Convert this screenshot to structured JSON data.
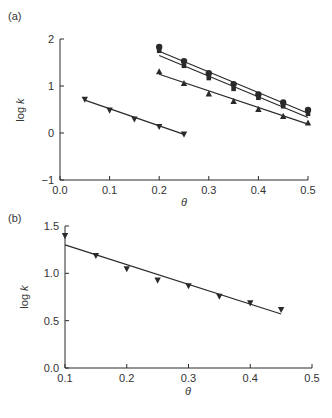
{
  "chart_data": [
    {
      "panel_label": "(a)",
      "type": "scatter",
      "xlabel": "θ",
      "ylabel": "log k",
      "xlim": [
        0.0,
        0.5
      ],
      "ylim": [
        -1,
        2
      ],
      "xticks": [
        "0.0",
        "0.1",
        "0.2",
        "0.3",
        "0.4",
        "0.5"
      ],
      "yticks": [
        "-1",
        "0",
        "1",
        "2"
      ],
      "grid": false,
      "legend": null,
      "series": [
        {
          "name": "circles",
          "marker": "circle",
          "x": [
            0.2,
            0.25,
            0.3,
            0.35,
            0.4,
            0.45,
            0.5
          ],
          "values": [
            1.83,
            1.53,
            1.27,
            1.04,
            0.82,
            0.65,
            0.49
          ],
          "fit": [
            [
              0.2,
              1.74
            ],
            [
              0.5,
              0.42
            ]
          ]
        },
        {
          "name": "squares",
          "marker": "square",
          "x": [
            0.2,
            0.25,
            0.3,
            0.35,
            0.4,
            0.45,
            0.5
          ],
          "values": [
            1.75,
            1.43,
            1.17,
            0.94,
            0.75,
            0.57,
            0.41
          ],
          "fit": [
            [
              0.2,
              1.65
            ],
            [
              0.5,
              0.33
            ]
          ]
        },
        {
          "name": "triangles-up",
          "marker": "triangle-up",
          "x": [
            0.2,
            0.25,
            0.3,
            0.35,
            0.4,
            0.45,
            0.5
          ],
          "values": [
            1.3,
            1.05,
            0.83,
            0.67,
            0.5,
            0.35,
            0.21
          ],
          "fit": [
            [
              0.2,
              1.25
            ],
            [
              0.5,
              0.19
            ]
          ]
        },
        {
          "name": "triangles-down",
          "marker": "triangle-down",
          "x": [
            0.05,
            0.1,
            0.15,
            0.2,
            0.25
          ],
          "values": [
            0.72,
            0.49,
            0.3,
            0.14,
            -0.02
          ],
          "fit": [
            [
              0.05,
              0.7
            ],
            [
              0.25,
              -0.03
            ]
          ]
        }
      ]
    },
    {
      "panel_label": "(b)",
      "type": "scatter",
      "xlabel": "θ",
      "ylabel": "log k",
      "xlim": [
        0.1,
        0.5
      ],
      "ylim": [
        0.0,
        1.5
      ],
      "xticks": [
        "0.1",
        "0.2",
        "0.3",
        "0.4",
        "0.5"
      ],
      "yticks": [
        "0.0",
        "0.5",
        "1.0",
        "1.5"
      ],
      "grid": false,
      "legend": null,
      "series": [
        {
          "name": "triangles-down",
          "marker": "triangle-down",
          "x": [
            0.1,
            0.15,
            0.2,
            0.25,
            0.3,
            0.35,
            0.4,
            0.45
          ],
          "values": [
            1.4,
            1.19,
            1.05,
            0.93,
            0.87,
            0.76,
            0.69,
            0.62
          ],
          "fit": [
            [
              0.1,
              1.3
            ],
            [
              0.45,
              0.57
            ]
          ]
        }
      ]
    }
  ],
  "style": {
    "ink": "#2a2a2a",
    "background": "#ffffff"
  }
}
